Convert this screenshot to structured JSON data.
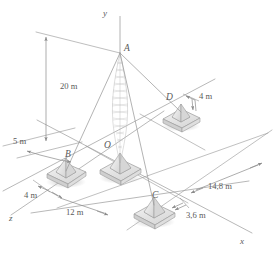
{
  "figure": {
    "type": "3d-engineering-diagram",
    "background_color": "#ffffff",
    "line_color": "#999999",
    "text_color": "#5a5a5a",
    "shadow_color": "#cccccc"
  },
  "axes": [
    {
      "id": "y",
      "label": "y",
      "direction": "up"
    },
    {
      "id": "x",
      "label": "x",
      "direction": "lower-right"
    },
    {
      "id": "z",
      "label": "z",
      "direction": "lower-left"
    }
  ],
  "points": [
    {
      "id": "A",
      "label": "A",
      "description": "mast apex"
    },
    {
      "id": "O",
      "label": "O",
      "description": "origin at mast base"
    },
    {
      "id": "B",
      "label": "B",
      "description": "anchor foundation left"
    },
    {
      "id": "C",
      "label": "C",
      "description": "anchor foundation front"
    },
    {
      "id": "D",
      "label": "D",
      "description": "anchor foundation right"
    }
  ],
  "dimensions": [
    {
      "id": "height",
      "value": "20 m",
      "describes": "mast height O to A"
    },
    {
      "id": "offset5",
      "value": "5 m",
      "describes": "horizontal offset to apex projection"
    },
    {
      "id": "b-z",
      "value": "4 m",
      "describes": "B offset along z"
    },
    {
      "id": "b-x",
      "value": "12 m",
      "describes": "B distance along x"
    },
    {
      "id": "d-x",
      "value": "4 m",
      "describes": "D offset"
    },
    {
      "id": "c-far",
      "value": "14,8 m",
      "describes": "distance to far edge"
    },
    {
      "id": "c-x",
      "value": "3,6 m",
      "describes": "C offset along x"
    }
  ]
}
